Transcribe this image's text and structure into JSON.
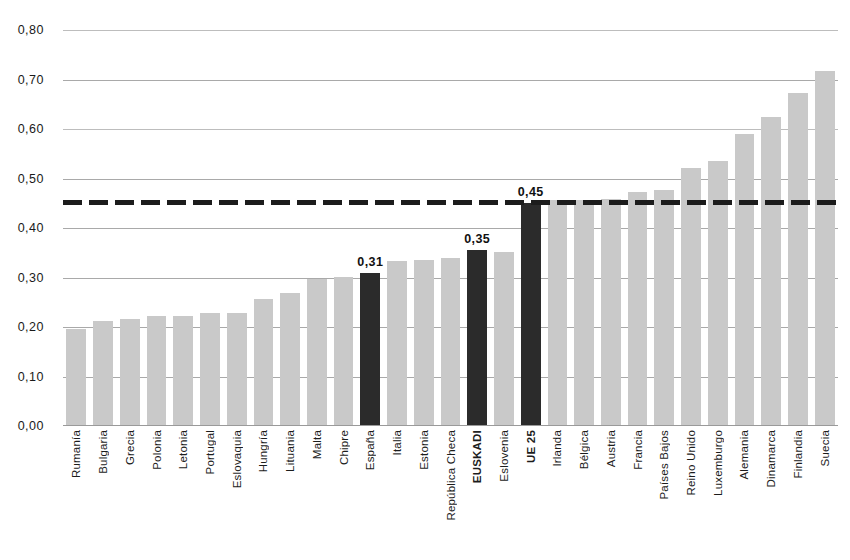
{
  "chart_data": {
    "type": "bar",
    "title": "",
    "subtitle": "",
    "xlabel": "",
    "ylabel": "",
    "ylim": [
      0.0,
      0.8
    ],
    "ytick_labels": [
      "0,00",
      "0,10",
      "0,20",
      "0,30",
      "0,40",
      "0,50",
      "0,60",
      "0,70",
      "0,80"
    ],
    "ytick_values": [
      0.0,
      0.1,
      0.2,
      0.3,
      0.4,
      0.5,
      0.6,
      0.7,
      0.8
    ],
    "grid": true,
    "legend": "none",
    "decimal_separator": ",",
    "categories": [
      "Rumanía",
      "Bulgaria",
      "Grecia",
      "Polonia",
      "Letonia",
      "Portugal",
      "Eslovaquia",
      "Hungría",
      "Lituania",
      "Malta",
      "Chipre",
      "España",
      "Italia",
      "Estonia",
      "República Checa",
      "EUSKADI",
      "Eslovenia",
      "UE 25",
      "Irlanda",
      "Bélgica",
      "Austria",
      "Francia",
      "Países Bajos",
      "Reino Unido",
      "Luxemburgo",
      "Alemania",
      "Dinamarca",
      "Finlandia",
      "Suecia"
    ],
    "values": [
      0.195,
      0.212,
      0.217,
      0.222,
      0.222,
      0.228,
      0.229,
      0.257,
      0.268,
      0.296,
      0.301,
      0.31,
      0.334,
      0.336,
      0.34,
      0.355,
      0.352,
      0.45,
      0.456,
      0.457,
      0.458,
      0.472,
      0.477,
      0.521,
      0.535,
      0.59,
      0.625,
      0.672,
      0.718
    ],
    "highlighted": [
      "España",
      "EUSKADI",
      "UE 25"
    ],
    "data_labels": [
      {
        "category": "España",
        "text": "0,31"
      },
      {
        "category": "EUSKADI",
        "text": "0,35"
      },
      {
        "category": "UE 25",
        "text": "0,45"
      }
    ],
    "reference_line": {
      "value": 0.452,
      "style": "dashed",
      "label": "0,45"
    },
    "colors": {
      "bar": "#c9c9c9",
      "bar_highlight": "#2b2b2b",
      "grid": "#a9a9a9",
      "reference_line": "#1c1c1c",
      "text": "#1a1a1a",
      "background": "#ffffff"
    }
  }
}
